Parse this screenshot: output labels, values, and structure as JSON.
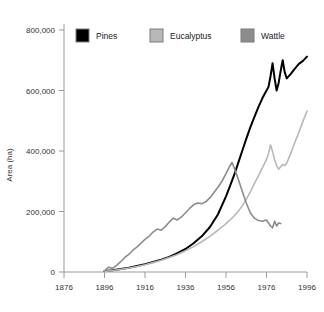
{
  "chart_data": {
    "type": "line",
    "title": "",
    "xlabel": "",
    "ylabel": "Area (ha)",
    "xlim": [
      1876,
      1996
    ],
    "ylim": [
      0,
      800000
    ],
    "grid": false,
    "legend_position": "top",
    "x_ticks": [
      "1876",
      "1896",
      "1916",
      "1936",
      "1956",
      "1976",
      "1996"
    ],
    "x_tick_values": [
      1876,
      1896,
      1916,
      1936,
      1956,
      1976,
      1996
    ],
    "y_ticks": [
      "0",
      "200,000",
      "400,000",
      "600,000",
      "800,000"
    ],
    "y_tick_values": [
      0,
      200000,
      400000,
      600000,
      800000
    ],
    "series": [
      {
        "name": "Pines",
        "color": "#000000",
        "width": 2.0,
        "points": [
          [
            1896,
            3000
          ],
          [
            1900,
            6000
          ],
          [
            1904,
            10000
          ],
          [
            1908,
            14000
          ],
          [
            1912,
            20000
          ],
          [
            1916,
            26000
          ],
          [
            1920,
            33000
          ],
          [
            1924,
            41000
          ],
          [
            1928,
            50000
          ],
          [
            1932,
            62000
          ],
          [
            1936,
            76000
          ],
          [
            1940,
            95000
          ],
          [
            1944,
            118000
          ],
          [
            1948,
            148000
          ],
          [
            1952,
            190000
          ],
          [
            1956,
            250000
          ],
          [
            1958,
            285000
          ],
          [
            1960,
            320000
          ],
          [
            1962,
            360000
          ],
          [
            1964,
            400000
          ],
          [
            1966,
            440000
          ],
          [
            1968,
            478000
          ],
          [
            1970,
            512000
          ],
          [
            1972,
            545000
          ],
          [
            1974,
            575000
          ],
          [
            1976,
            600000
          ],
          [
            1977,
            612000
          ],
          [
            1978,
            648000
          ],
          [
            1979,
            690000
          ],
          [
            1980,
            640000
          ],
          [
            1981,
            600000
          ],
          [
            1982,
            625000
          ],
          [
            1983,
            665000
          ],
          [
            1984,
            700000
          ],
          [
            1985,
            660000
          ],
          [
            1986,
            640000
          ],
          [
            1988,
            655000
          ],
          [
            1990,
            672000
          ],
          [
            1992,
            688000
          ],
          [
            1994,
            698000
          ],
          [
            1996,
            712000
          ]
        ]
      },
      {
        "name": "Eucalyptus",
        "color": "#b8b8b8",
        "width": 1.6,
        "points": [
          [
            1896,
            2000
          ],
          [
            1900,
            5000
          ],
          [
            1904,
            9000
          ],
          [
            1908,
            13000
          ],
          [
            1912,
            18000
          ],
          [
            1916,
            24000
          ],
          [
            1920,
            31000
          ],
          [
            1924,
            39000
          ],
          [
            1928,
            48000
          ],
          [
            1932,
            58000
          ],
          [
            1936,
            70000
          ],
          [
            1940,
            84000
          ],
          [
            1944,
            100000
          ],
          [
            1948,
            118000
          ],
          [
            1952,
            138000
          ],
          [
            1956,
            160000
          ],
          [
            1958,
            172000
          ],
          [
            1960,
            185000
          ],
          [
            1962,
            200000
          ],
          [
            1964,
            218000
          ],
          [
            1966,
            240000
          ],
          [
            1968,
            265000
          ],
          [
            1970,
            292000
          ],
          [
            1972,
            318000
          ],
          [
            1974,
            345000
          ],
          [
            1976,
            372000
          ],
          [
            1977,
            392000
          ],
          [
            1978,
            420000
          ],
          [
            1979,
            398000
          ],
          [
            1980,
            372000
          ],
          [
            1981,
            352000
          ],
          [
            1982,
            340000
          ],
          [
            1983,
            348000
          ],
          [
            1984,
            355000
          ],
          [
            1985,
            352000
          ],
          [
            1986,
            360000
          ],
          [
            1988,
            392000
          ],
          [
            1990,
            428000
          ],
          [
            1992,
            462000
          ],
          [
            1994,
            498000
          ],
          [
            1996,
            532000
          ]
        ]
      },
      {
        "name": "Wattle",
        "color": "#8c8c8c",
        "width": 1.6,
        "points": [
          [
            1896,
            4000
          ],
          [
            1898,
            16000
          ],
          [
            1900,
            12000
          ],
          [
            1902,
            22000
          ],
          [
            1904,
            34000
          ],
          [
            1906,
            48000
          ],
          [
            1908,
            58000
          ],
          [
            1910,
            72000
          ],
          [
            1912,
            82000
          ],
          [
            1914,
            95000
          ],
          [
            1916,
            108000
          ],
          [
            1918,
            118000
          ],
          [
            1920,
            132000
          ],
          [
            1922,
            142000
          ],
          [
            1924,
            138000
          ],
          [
            1926,
            150000
          ],
          [
            1928,
            165000
          ],
          [
            1930,
            178000
          ],
          [
            1932,
            172000
          ],
          [
            1934,
            182000
          ],
          [
            1936,
            196000
          ],
          [
            1938,
            210000
          ],
          [
            1940,
            222000
          ],
          [
            1942,
            228000
          ],
          [
            1944,
            226000
          ],
          [
            1946,
            232000
          ],
          [
            1948,
            245000
          ],
          [
            1950,
            262000
          ],
          [
            1952,
            280000
          ],
          [
            1954,
            300000
          ],
          [
            1956,
            325000
          ],
          [
            1958,
            352000
          ],
          [
            1959,
            362000
          ],
          [
            1960,
            345000
          ],
          [
            1962,
            308000
          ],
          [
            1964,
            268000
          ],
          [
            1966,
            228000
          ],
          [
            1968,
            196000
          ],
          [
            1970,
            178000
          ],
          [
            1972,
            170000
          ],
          [
            1974,
            168000
          ],
          [
            1976,
            172000
          ],
          [
            1978,
            152000
          ],
          [
            1979,
            146000
          ],
          [
            1980,
            168000
          ],
          [
            1981,
            152000
          ],
          [
            1982,
            162000
          ],
          [
            1983,
            160000
          ]
        ]
      }
    ]
  },
  "legend": {
    "items": [
      {
        "label": "Pines",
        "color": "#000000"
      },
      {
        "label": "Eucalyptus",
        "color": "#b8b8b8"
      },
      {
        "label": "Wattle",
        "color": "#8c8c8c"
      }
    ]
  }
}
